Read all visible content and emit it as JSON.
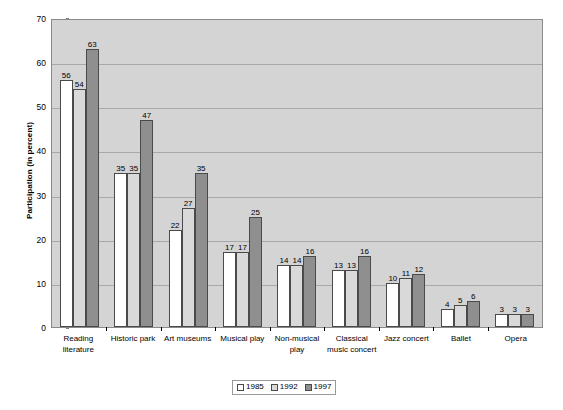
{
  "chart_data": {
    "type": "bar",
    "title": "",
    "subtitle": "",
    "xlabel": "",
    "ylabel": "Participation (in percent)",
    "ylim": [
      0,
      70
    ],
    "ytick_step": 10,
    "yticks": [
      "0",
      "10",
      "20",
      "30",
      "40",
      "50",
      "60",
      "70"
    ],
    "grid": "horizontal",
    "legend_position": "bottom-center",
    "categories": [
      "Reading literature",
      "Historic park",
      "Art museums",
      "Musical play",
      "Non-musical play",
      "Classical music concert",
      "Jazz concert",
      "Ballet",
      "Opera"
    ],
    "series": [
      {
        "name": "1985",
        "color": "#ffffff",
        "values": [
          56,
          35,
          22,
          17,
          14,
          13,
          10,
          4,
          3
        ]
      },
      {
        "name": "1992",
        "color": "#d9d9d9",
        "values": [
          54,
          35,
          27,
          17,
          14,
          13,
          11,
          5,
          3
        ]
      },
      {
        "name": "1997",
        "color": "#8f8f8f",
        "values": [
          63,
          47,
          35,
          25,
          16,
          16,
          12,
          6,
          3
        ]
      }
    ]
  },
  "colors": {
    "plot_background": "#d4d4d4",
    "gridline": "#a8a8a8",
    "axis": "#000000",
    "bar_border": "#4a4a4a",
    "series_1985": "#ffffff",
    "series_1992": "#d9d9d9",
    "series_1997": "#8f8f8f"
  }
}
